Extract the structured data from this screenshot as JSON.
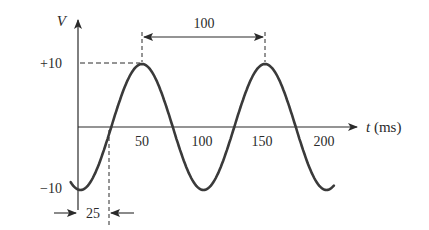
{
  "figure": {
    "type": "sinusoidal-waveform-diagram",
    "y_axis": {
      "label": "V",
      "ticks": [
        "+10",
        "−10"
      ]
    },
    "x_axis": {
      "label": "t (ms)",
      "ticks": [
        "50",
        "100",
        "150",
        "200"
      ]
    },
    "annotations": {
      "period_label": "100",
      "offset_label": "25"
    },
    "colors": {
      "stroke": "#3a3a3a",
      "text": "#2b2b2b",
      "background": "#ffffff"
    }
  },
  "chart_data": {
    "type": "line",
    "title": "",
    "xlabel": "t (ms)",
    "ylabel": "V",
    "function": "v(t) = 10 sin(2π(t - 25)/100)",
    "amplitude": 10,
    "period_ms": 100,
    "phase_offset_ms": 25,
    "x_ticks": [
      50,
      100,
      150,
      200
    ],
    "y_ticks": [
      10,
      -10
    ],
    "xlim": [
      -5,
      205
    ],
    "ylim": [
      -10,
      10
    ],
    "key_points": [
      {
        "t": 0,
        "v": -10
      },
      {
        "t": 25,
        "v": 0
      },
      {
        "t": 50,
        "v": 10
      },
      {
        "t": 75,
        "v": 0
      },
      {
        "t": 100,
        "v": -10
      },
      {
        "t": 125,
        "v": 0
      },
      {
        "t": 150,
        "v": 10
      },
      {
        "t": 175,
        "v": 0
      },
      {
        "t": 200,
        "v": -10
      }
    ],
    "grid": false,
    "legend": null
  }
}
